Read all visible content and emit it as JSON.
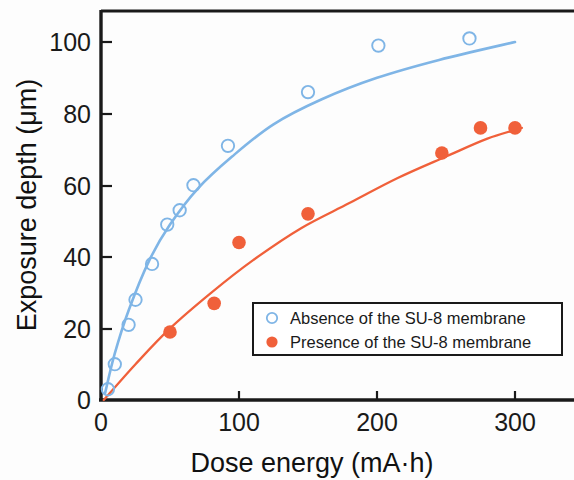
{
  "chart_data": {
    "type": "scatter",
    "title": "",
    "xlabel": "Dose energy (mA·h)",
    "ylabel": "Exposure depth (μm)",
    "xlim": [
      0,
      310
    ],
    "ylim": [
      0,
      108
    ],
    "xticks": [
      0,
      100,
      200,
      300
    ],
    "xtick_labels": [
      "0",
      "100",
      "200",
      "300"
    ],
    "yticks": [
      0,
      20,
      40,
      60,
      80,
      100
    ],
    "ytick_labels": [
      "0",
      "20",
      "40",
      "60",
      "80",
      "100"
    ],
    "grid": false,
    "legend_position": "lower-right-inside",
    "series": [
      {
        "name": "Absence of the SU-8 membrane",
        "marker": "open-circle",
        "color": "#7FB5E6",
        "points": [
          {
            "x": 5,
            "y": 3
          },
          {
            "x": 10,
            "y": 10
          },
          {
            "x": 20,
            "y": 21
          },
          {
            "x": 25,
            "y": 28
          },
          {
            "x": 37,
            "y": 38
          },
          {
            "x": 48,
            "y": 49
          },
          {
            "x": 57,
            "y": 53
          },
          {
            "x": 67,
            "y": 60
          },
          {
            "x": 92,
            "y": 71
          },
          {
            "x": 150,
            "y": 86
          },
          {
            "x": 201,
            "y": 99
          },
          {
            "x": 267,
            "y": 101
          }
        ],
        "fit_curve": [
          {
            "x": 3,
            "y": 2
          },
          {
            "x": 10,
            "y": 13
          },
          {
            "x": 20,
            "y": 25
          },
          {
            "x": 35,
            "y": 39
          },
          {
            "x": 50,
            "y": 49
          },
          {
            "x": 70,
            "y": 59
          },
          {
            "x": 95,
            "y": 68
          },
          {
            "x": 125,
            "y": 77
          },
          {
            "x": 160,
            "y": 84
          },
          {
            "x": 200,
            "y": 90
          },
          {
            "x": 245,
            "y": 95
          },
          {
            "x": 300,
            "y": 100
          }
        ]
      },
      {
        "name": "Presence of the SU-8 membrane",
        "marker": "filled-circle",
        "color": "#F0603A",
        "points": [
          {
            "x": 50,
            "y": 19
          },
          {
            "x": 82,
            "y": 27
          },
          {
            "x": 100,
            "y": 44
          },
          {
            "x": 150,
            "y": 52
          },
          {
            "x": 247,
            "y": 69
          },
          {
            "x": 275,
            "y": 76
          },
          {
            "x": 300,
            "y": 76
          }
        ],
        "fit_curve": [
          {
            "x": 2,
            "y": 0
          },
          {
            "x": 25,
            "y": 10
          },
          {
            "x": 50,
            "y": 20
          },
          {
            "x": 80,
            "y": 30
          },
          {
            "x": 110,
            "y": 39
          },
          {
            "x": 145,
            "y": 48
          },
          {
            "x": 180,
            "y": 55
          },
          {
            "x": 215,
            "y": 62
          },
          {
            "x": 250,
            "y": 68
          },
          {
            "x": 280,
            "y": 73
          },
          {
            "x": 305,
            "y": 76
          }
        ]
      }
    ],
    "legend": [
      {
        "label": "Absence of the SU-8 membrane",
        "marker": "open-circle",
        "color": "#7FB5E6"
      },
      {
        "label": "Presence of the SU-8 membrane",
        "marker": "filled-circle",
        "color": "#F0603A"
      }
    ]
  }
}
